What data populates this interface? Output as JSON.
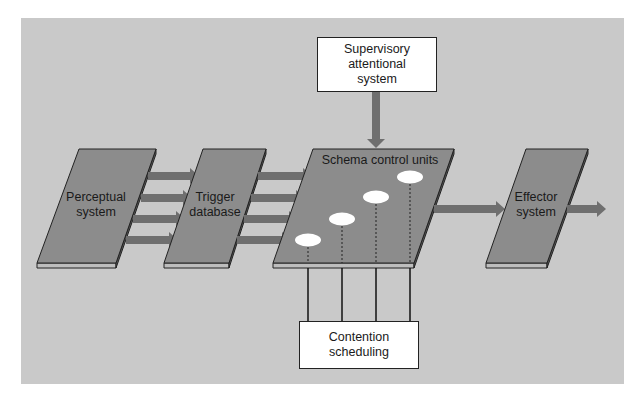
{
  "diagram": {
    "colors": {
      "background": "#c9c9c9",
      "module_fill": "#8c8c8c",
      "module_slab": "#bdbdbd",
      "arrow": "#6f6f6f",
      "box_fill": "#ffffff",
      "line": "#1a1a1a"
    },
    "nodes": {
      "supervisory": {
        "line1": "Supervisory",
        "line2": "attentional",
        "line3": "system"
      },
      "perceptual": {
        "line1": "Perceptual",
        "line2": "system"
      },
      "trigger": {
        "line1": "Trigger",
        "line2": "database"
      },
      "schema": {
        "label": "Schema control units",
        "unit_count": 4
      },
      "effector": {
        "line1": "Effector",
        "line2": "system"
      },
      "contention": {
        "line1": "Contention",
        "line2": "scheduling"
      }
    },
    "edges": [
      {
        "from": "perceptual",
        "to": "trigger",
        "count": 4
      },
      {
        "from": "trigger",
        "to": "schema",
        "count": 4
      },
      {
        "from": "supervisory",
        "to": "schema",
        "count": 1
      },
      {
        "from": "schema",
        "to": "effector",
        "count": 1
      },
      {
        "from": "effector",
        "to": "output",
        "count": 1
      },
      {
        "from": "contention",
        "to": "schema",
        "count": 4,
        "style": "lines"
      }
    ]
  }
}
